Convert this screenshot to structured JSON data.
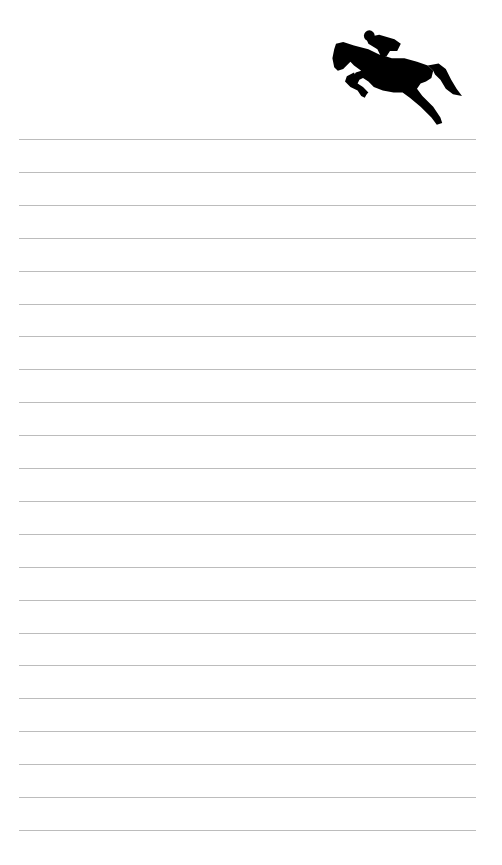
{
  "notepad": {
    "emblem": {
      "icon": "horse-jumping-rider-icon",
      "color": "#000000"
    },
    "lines": {
      "count": 22,
      "first_y": 139,
      "spacing": 32.9,
      "color": "#bcbcbc"
    }
  }
}
